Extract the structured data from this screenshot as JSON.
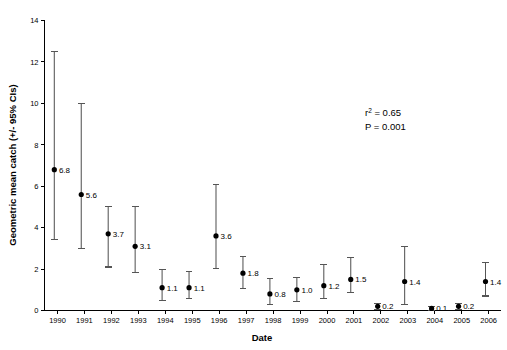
{
  "chart_data": {
    "type": "scatter",
    "title": "",
    "xlabel": "Date",
    "ylabel": "Geometric mean catch (+/- 95% CIs)",
    "xlim": [
      1989.4,
      2006.6
    ],
    "ylim": [
      0,
      14
    ],
    "yticks": [
      0,
      2,
      4,
      6,
      8,
      10,
      12,
      14
    ],
    "ytick_labels": [
      "0",
      "2",
      "4",
      "6",
      "8",
      "10",
      "12",
      "14"
    ],
    "categories": [
      1990,
      1991,
      1992,
      1993,
      1994,
      1995,
      1996,
      1997,
      1998,
      1999,
      2000,
      2001,
      2002,
      2003,
      2004,
      2005,
      2006
    ],
    "xtick_labels": [
      "1990",
      "1991",
      "1992",
      "1993",
      "1994",
      "1995",
      "1996",
      "1997",
      "1998",
      "1999",
      "2000",
      "2001",
      "2002",
      "2003",
      "2004",
      "2005",
      "2006"
    ],
    "values": [
      6.8,
      5.6,
      3.7,
      3.1,
      1.1,
      1.1,
      3.6,
      1.8,
      0.8,
      1.0,
      1.2,
      1.5,
      0.2,
      1.4,
      0.1,
      0.2,
      1.4
    ],
    "value_labels": [
      "6.8",
      "5.6",
      "3.7",
      "3.1",
      "1.1",
      "1.1",
      "3.6",
      "1.8",
      "0.8",
      "1.0",
      "1.2",
      "1.5",
      "0.2",
      "1.4",
      "0.1",
      "0.2",
      "1.4"
    ],
    "ci_lower": [
      3.45,
      3.0,
      2.1,
      1.85,
      0.5,
      0.6,
      2.05,
      1.05,
      0.3,
      0.45,
      0.6,
      0.85,
      0.05,
      0.3,
      0.02,
      0.05,
      0.7
    ],
    "ci_upper": [
      12.5,
      10.0,
      5.0,
      5.0,
      2.0,
      1.9,
      6.1,
      2.6,
      1.55,
      1.6,
      2.2,
      2.55,
      0.35,
      3.1,
      0.18,
      0.35,
      2.3
    ],
    "grid": false,
    "legend": false,
    "marker_color": "#000000",
    "errorbar_color": "#555555",
    "annotations": [
      {
        "text_main": "r",
        "text_sup": "2",
        "text_rest": " = 0.65"
      },
      {
        "text_main": "P = 0.001",
        "text_sup": "",
        "text_rest": ""
      }
    ],
    "annotation_r2": "r",
    "annotation_r2_sup": "2",
    "annotation_r2_rest": " = 0.65",
    "annotation_p": "P = 0.001"
  }
}
